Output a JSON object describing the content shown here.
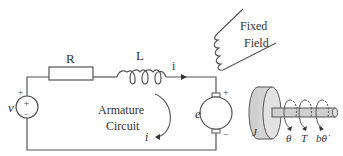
{
  "diagram": {
    "circuit": {
      "resistor_label": "R",
      "inductor_label": "L",
      "current_label_top": "i",
      "source_label": "v",
      "source_plus": "+",
      "source_inner_plus": "+",
      "source_minus": "−",
      "loop_label_line1": "Armature",
      "loop_label_line2": "Circuit",
      "loop_current_label": "i",
      "motor_emf_label": "e",
      "motor_plus": "+",
      "motor_minus": "−"
    },
    "field": {
      "label_line1": "Fixed",
      "label_line2": "Field"
    },
    "rotor": {
      "inertia_label": "J",
      "angle_label": "θ",
      "torque_label": "T",
      "damping_label": "bθ̇"
    },
    "colors": {
      "line": "#555555",
      "rotor_fill": "#d4d4d4",
      "rotor_face": "#e4e4e4",
      "shaft_fill": "#cfcfcf"
    }
  }
}
